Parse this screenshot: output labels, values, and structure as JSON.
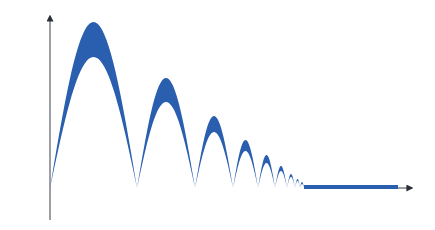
{
  "diagram": {
    "colors": {
      "fill": "#2a5fb0",
      "axis": "#3a3f4a",
      "baseline_left": "#6f9a8c",
      "baseline_mid": "#d99a8e",
      "baseline_right": "#8f9bb0",
      "background": "#ffffff"
    },
    "baseline_y": 188,
    "y_axis": {
      "x": 50,
      "top": 16,
      "bottom": 220
    },
    "x_axis": {
      "y": 188,
      "left": 18,
      "right": 412
    },
    "arches": [
      {
        "x0": 50,
        "x1": 137,
        "outer_peak": 22,
        "inner_peak": 57
      },
      {
        "x0": 137,
        "x1": 195,
        "outer_peak": 78,
        "inner_peak": 102
      },
      {
        "x0": 195,
        "x1": 233,
        "outer_peak": 116,
        "inner_peak": 132
      },
      {
        "x0": 233,
        "x1": 258,
        "outer_peak": 140,
        "inner_peak": 151
      },
      {
        "x0": 258,
        "x1": 275,
        "outer_peak": 155,
        "inner_peak": 163
      },
      {
        "x0": 275,
        "x1": 287,
        "outer_peak": 166,
        "inner_peak": 171
      },
      {
        "x0": 287,
        "x1": 295,
        "outer_peak": 174,
        "inner_peak": 177
      },
      {
        "x0": 295,
        "x1": 300,
        "outer_peak": 179,
        "inner_peak": 181
      },
      {
        "x0": 300,
        "x1": 304,
        "outer_peak": 182,
        "inner_peak": 184
      }
    ],
    "flat_band": {
      "x0": 304,
      "x1": 398,
      "top": 185,
      "bottom": 189
    }
  }
}
